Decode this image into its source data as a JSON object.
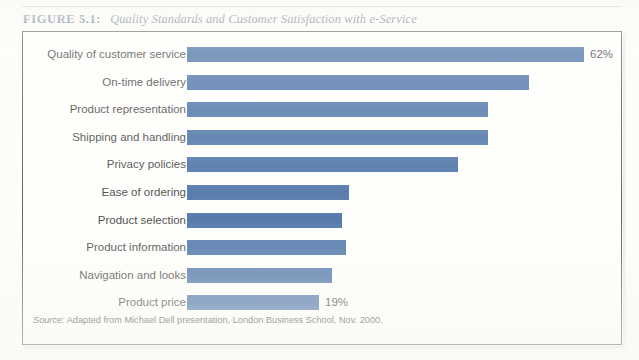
{
  "figure": {
    "label": "FIGURE 5.1:",
    "title": "Quality Standards and Customer Satisfaction with e-Service",
    "source_prefix": "Source:",
    "source_text": "Adapted from Michael Dell presentation, London Business School, Nov. 2000."
  },
  "colors": {
    "bar": "#2b5b9a",
    "caption_label": "#1d3864",
    "caption_title": "#1a2d4d",
    "box_border": "#3b3b3b",
    "text": "#222222",
    "page_background": "#fdfdfb"
  },
  "chart_data": {
    "type": "bar",
    "orientation": "horizontal",
    "title": "Quality Standards and Customer Satisfaction with e-Service",
    "xlabel": "",
    "ylabel": "",
    "xlim": [
      0,
      65
    ],
    "grid": false,
    "legend": false,
    "categories": [
      "Quality of customer service",
      "On-time delivery",
      "Product representation",
      "Shipping and handling",
      "Privacy policies",
      "Ease of ordering",
      "Product selection",
      "Product information",
      "Navigation and looks",
      "Product price"
    ],
    "values": [
      62,
      52,
      46,
      46,
      42,
      25,
      24,
      25,
      22,
      19
    ],
    "data_labels": [
      "62%",
      "",
      "",
      "",
      "",
      "",
      "",
      "",
      "",
      "19%"
    ],
    "series": [
      {
        "name": "Percent of customers",
        "values": [
          62,
          52,
          46,
          46,
          42,
          25,
          24,
          25,
          22,
          19
        ]
      }
    ],
    "bars": [
      {
        "label": "Quality of customer service",
        "value": 62,
        "display": "62%",
        "pixel_width": 397
      },
      {
        "label": "On-time delivery",
        "value": 52,
        "display": "",
        "pixel_width": 342
      },
      {
        "label": "Product representation",
        "value": 46,
        "display": "",
        "pixel_width": 301
      },
      {
        "label": "Shipping and handling",
        "value": 46,
        "display": "",
        "pixel_width": 301
      },
      {
        "label": "Privacy policies",
        "value": 42,
        "display": "",
        "pixel_width": 271
      },
      {
        "label": "Ease of ordering",
        "value": 25,
        "display": "",
        "pixel_width": 162
      },
      {
        "label": "Product selection",
        "value": 24,
        "display": "",
        "pixel_width": 155
      },
      {
        "label": "Product information",
        "value": 25,
        "display": "",
        "pixel_width": 159
      },
      {
        "label": "Navigation and looks",
        "value": 22,
        "display": "",
        "pixel_width": 145
      },
      {
        "label": "Product price",
        "value": 19,
        "display": "19%",
        "pixel_width": 132
      }
    ]
  }
}
